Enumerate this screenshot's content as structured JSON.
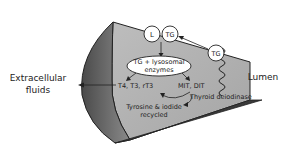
{
  "diagram": {
    "labels": {
      "extracellular_line1": "Extracellular",
      "extracellular_line2": "fluids",
      "lumen": "Lumen",
      "circle_L": "L",
      "circle_TG": "TG",
      "circle_TG_lumen": "TG",
      "ellipse_line1": "TG + lysosomal",
      "ellipse_line2": "enzymes",
      "hormones": "T4, T3, rT3",
      "mit_dit": "MIT, DIT",
      "deiodinase": "Thyroid deiodinase",
      "recycled_line1": "Tyrosine & iodide",
      "recycled_line2": "recycled"
    },
    "colors": {
      "cell_body": "#b3b3b3",
      "cell_dark_face": "#6e6e6e",
      "cell_bottom": "#4d4d4d",
      "outline": "#222222",
      "bubble_fill": "#ffffff"
    }
  }
}
